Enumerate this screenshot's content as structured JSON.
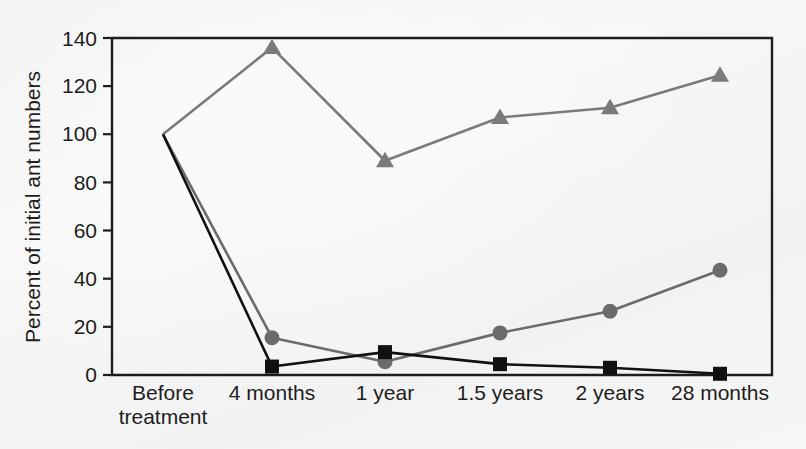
{
  "chart_data": {
    "type": "line",
    "title": "",
    "subtitle": "",
    "xlabel": "",
    "ylabel": "Percent of initial ant numbers",
    "categories": [
      "Before\ntreatment",
      "4 months",
      "1 year",
      "1.5 years",
      "2 years",
      "28 months"
    ],
    "category_labels": [
      {
        "line1": "Before",
        "line2": "treatment"
      },
      {
        "line1": "4 months",
        "line2": ""
      },
      {
        "line1": "1 year",
        "line2": ""
      },
      {
        "line1": "1.5 years",
        "line2": ""
      },
      {
        "line1": "2 years",
        "line2": ""
      },
      {
        "line1": "28 months",
        "line2": ""
      }
    ],
    "ylim": [
      0,
      140
    ],
    "yticks": [
      0,
      20,
      40,
      60,
      80,
      100,
      120,
      140
    ],
    "ytick_labels": [
      "0",
      "20",
      "40",
      "60",
      "80",
      "100",
      "120",
      "140"
    ],
    "grid": false,
    "legend": "none",
    "series": [
      {
        "name": "triangle-series",
        "marker": "triangle",
        "color": "#7a7a7a",
        "values": [
          100,
          136,
          89,
          107,
          111,
          124.5
        ]
      },
      {
        "name": "circle-series",
        "marker": "circle",
        "color": "#6b6b6b",
        "values": [
          100,
          15.5,
          5.5,
          17.5,
          26.5,
          43.5
        ]
      },
      {
        "name": "square-series",
        "marker": "square",
        "color": "#111111",
        "values": [
          100,
          3.5,
          9.5,
          4.5,
          3,
          0.5
        ]
      }
    ]
  },
  "colors": {
    "background": "#f4f4f4",
    "axis": "#1d1d1d",
    "gray_series": "#7a7a7a",
    "black_series": "#111111"
  }
}
